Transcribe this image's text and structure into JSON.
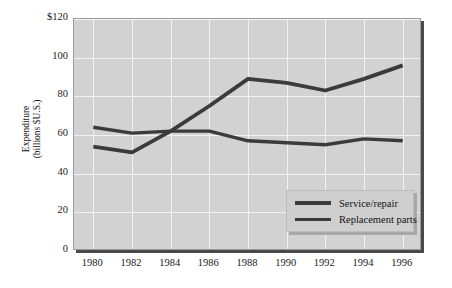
{
  "chart_data": {
    "type": "line",
    "title": "",
    "xlabel": "",
    "ylabel": "Expenditure (billions $U.S.)",
    "ylabel_line1": "Expenditure",
    "ylabel_line2": "(billions $U.S.)",
    "x": [
      1980,
      1982,
      1984,
      1986,
      1988,
      1990,
      1992,
      1994,
      1996
    ],
    "categories": [
      "1980",
      "1982",
      "1984",
      "1986",
      "1988",
      "1990",
      "1992",
      "1994",
      "1996"
    ],
    "xlim": [
      1979,
      1997
    ],
    "ylim": [
      0,
      120
    ],
    "yticks": [
      0,
      20,
      40,
      60,
      80,
      100,
      120
    ],
    "ytick_labels": [
      "0",
      "20",
      "40",
      "60",
      "80",
      "100",
      "$120"
    ],
    "grid": true,
    "legend_position": "lower right",
    "series": [
      {
        "name": "Service/repair",
        "values": [
          64,
          61,
          62,
          62,
          57,
          56,
          55,
          58,
          57
        ],
        "color": "#3b3b3b"
      },
      {
        "name": "Replacement parts",
        "values": [
          54,
          51,
          62,
          75,
          89,
          87,
          83,
          89,
          96
        ],
        "color": "#3b3b3b"
      }
    ],
    "colors": {
      "plot_background": "#d2d2d2",
      "gridline": "#f2f2f2",
      "line": "#3b3b3b",
      "frame_shadow": "#4a4a4a",
      "text": "#111111",
      "legend_background": "#cfcfcf"
    }
  },
  "legend": {
    "items": [
      {
        "label": "Service/repair"
      },
      {
        "label": "Replacement parts"
      }
    ]
  }
}
